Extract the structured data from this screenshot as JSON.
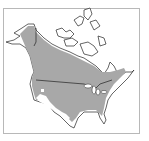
{
  "map": {
    "title": "Range map of North America",
    "region": "North America (Canada, United States)",
    "colors": {
      "range_fill": "#a8a8a8",
      "land_fill": "#ffffff",
      "outline": "#222222",
      "frame": "#b8b8b8"
    },
    "legend": []
  }
}
